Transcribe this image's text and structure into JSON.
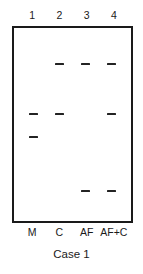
{
  "figure": {
    "caption": "Case 1",
    "gel": {
      "border_color": "#1a1a1a",
      "background_color": "#ffffff",
      "band_color": "#232323"
    }
  },
  "lanes": [
    {
      "number": "1",
      "sample_label": "M",
      "center_pct": 16.5
    },
    {
      "number": "2",
      "sample_label": "C",
      "center_pct": 38.8
    },
    {
      "number": "3",
      "sample_label": "AF",
      "center_pct": 61.2
    },
    {
      "number": "4",
      "sample_label": "AF+C",
      "center_pct": 83.5
    }
  ],
  "bands": [
    {
      "lane": 2,
      "row": 1,
      "x_pct": 38.8,
      "y_pct": 18.0
    },
    {
      "lane": 3,
      "row": 1,
      "x_pct": 61.2,
      "y_pct": 18.0
    },
    {
      "lane": 4,
      "row": 1,
      "x_pct": 83.5,
      "y_pct": 18.0
    },
    {
      "lane": 1,
      "row": 2,
      "x_pct": 16.5,
      "y_pct": 44.2
    },
    {
      "lane": 2,
      "row": 2,
      "x_pct": 38.8,
      "y_pct": 44.2
    },
    {
      "lane": 4,
      "row": 2,
      "x_pct": 83.5,
      "y_pct": 44.2
    },
    {
      "lane": 1,
      "row": 3,
      "x_pct": 16.5,
      "y_pct": 56.0
    },
    {
      "lane": 3,
      "row": 4,
      "x_pct": 61.2,
      "y_pct": 84.0
    },
    {
      "lane": 4,
      "row": 4,
      "x_pct": 83.5,
      "y_pct": 84.0
    }
  ],
  "chart_data": {
    "type": "table",
    "title": "Case 1",
    "xlabel": "",
    "ylabel": "",
    "categories": [
      "M",
      "C",
      "AF",
      "AF+C"
    ],
    "lane_numbers": [
      "1",
      "2",
      "3",
      "4"
    ],
    "band_rows": [
      "row1",
      "row2",
      "row3",
      "row4"
    ],
    "series": [
      {
        "name": "row1",
        "values": [
          0,
          1,
          1,
          1
        ]
      },
      {
        "name": "row2",
        "values": [
          1,
          1,
          0,
          1
        ]
      },
      {
        "name": "row3",
        "values": [
          1,
          0,
          0,
          0
        ]
      },
      {
        "name": "row4",
        "values": [
          0,
          0,
          1,
          1
        ]
      }
    ],
    "legend_position": "none",
    "grid": false
  }
}
